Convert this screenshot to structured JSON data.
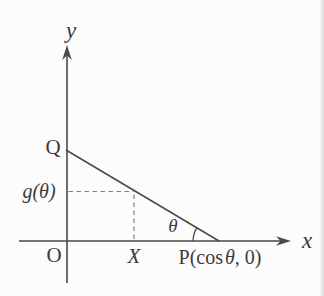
{
  "labels": {
    "y_axis": "y",
    "x_axis": "x",
    "origin": "O",
    "q_point": "Q",
    "g_theta": "g(θ)",
    "x_point": "X",
    "theta_angle": "θ",
    "p_point_prefix": "P(cos",
    "p_point_theta": "θ",
    "p_point_suffix": ", 0)"
  },
  "colors": {
    "line": "#4a4a4a",
    "dashed_line": "#7e7e7e",
    "text": "#3b3b3b",
    "background": "#fcfcfc"
  }
}
